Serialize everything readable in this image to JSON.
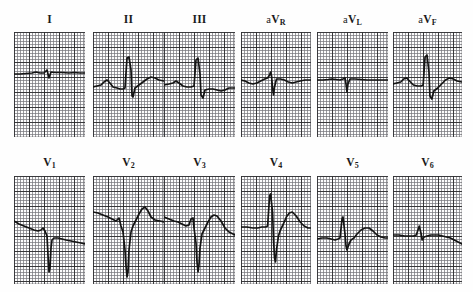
{
  "document": {
    "title": "12-Lead Electrocardiogram",
    "background_color": "#fefefe",
    "grid_fine_color": "#76767c",
    "grid_bold_color": "#28282a",
    "trace_color": "#141414"
  },
  "layout": {
    "rows": 2,
    "columns": 6,
    "panel_width": 71,
    "panel_height": 105,
    "panel_height_bottom": 108
  },
  "chart_data": {
    "type": "line",
    "xlabel": "Time",
    "ylabel": "Amplitude (mV)",
    "grid": "on",
    "legend": "none",
    "grid_small_mm": 1,
    "grid_large_mm": 5,
    "paper_speed": "25 mm/s",
    "calibration": "10 mm/mV",
    "series": [
      {
        "name": "I",
        "row": 0,
        "column": 0,
        "description": "low amplitude, nearly isoelectric with tiny QRS",
        "baseline_y": 73,
        "r_peak_y": 66,
        "s_nadir_y": 78,
        "points": "0,74 6,74 12,73.5 18,73 22,72 26,73 30,73 33,70 35,78 37,72 41,72.5 48,72.5 55,73 60,72.5 66,73 71,73"
      },
      {
        "name": "II",
        "row": 0,
        "column": 1,
        "description": "tall narrow R wave with deep S and upright T",
        "baseline_y": 88,
        "r_peak_y": 57,
        "s_nadir_y": 97,
        "points": "0,87 4,86 8,85 11,82 14,80 17,83 20,87 24,88 27,89 30,89 32,88 34,58 36,57 38,70 39,96 40,97 42,88 46,85 50,82 54,79 58,77 62,78 66,80 71,81"
      },
      {
        "name": "III",
        "row": 0,
        "column": 2,
        "description": "tall R wave with deep S wave and inverted/biphasic T",
        "baseline_y": 86,
        "r_peak_y": 58,
        "s_nadir_y": 98,
        "points": "0,85 5,84 9,83 12,81 15,83 19,86 23,87 27,87 30,86 32,60 34,58 36,74 37,95 39,98 41,90 45,89 49,89 53,90 57,91 61,90 65,88 71,88"
      },
      {
        "name": "aVR",
        "row": 0,
        "column": 3,
        "description": "small positive deflection with narrow downward spike",
        "baseline_y": 81,
        "r_peak_y": 72,
        "s_nadir_y": 95,
        "points": "0,80 4,81 8,83 12,84 16,83 20,81 24,79 27,78 29,75 30,72 31,76 32,88 33,95 34,87 36,79 40,79 44,80 48,82 52,83 56,82 60,81 65,80 71,80"
      },
      {
        "name": "aVL",
        "row": 0,
        "column": 4,
        "description": "almost flat isoelectric line with one small downward spike",
        "baseline_y": 80,
        "r_peak_y": 77,
        "s_nadir_y": 92,
        "points": "0,80 6,80 11,79.5 15,79 19,79.5 23,80 26,79 28,78 29,84 30,92 31,84 33,79 38,79 44,79.5 50,80 56,80 62,80 71,80"
      },
      {
        "name": "aVF",
        "row": 0,
        "column": 5,
        "description": "tall narrow R wave with deep S and upright T wave",
        "baseline_y": 85,
        "r_peak_y": 55,
        "s_nadir_y": 99,
        "points": "0,84 4,83 8,82 11,79 14,78 17,81 21,85 25,86 29,86 31,85 33,57 35,55 37,72 38,96 40,99 42,91 46,88 50,84 54,80 58,78 62,79 66,81 71,82"
      },
      {
        "name": "V1",
        "row": 1,
        "column": 0,
        "description": "rS pattern with deep narrow S wave, descending baseline",
        "baseline_y": 225,
        "r_peak_y": 222,
        "s_nadir_y": 272,
        "points": "0,221 5,224 10,226 15,228 20,230 24,231 27,230 29,228 31,231 33,236 34,255 35,272 36,268 37,248 38,240 40,238 44,238 48,239 52,240 57,241 62,242 67,243 71,244"
      },
      {
        "name": "V2",
        "row": 1,
        "column": 1,
        "description": "deep wide S wave with large upright T wave",
        "baseline_y": 232,
        "r_peak_y": 226,
        "s_nadir_y": 277,
        "points": "0,212 5,213 10,215 15,217 19,219 23,221 26,218 28,226 30,232 32,250 33,266 34,277 35,272 36,250 38,232 40,226 43,220 46,214 49,209 52,207 55,211 58,217 62,220 67,221 71,222"
      },
      {
        "name": "V3",
        "row": 1,
        "column": 2,
        "description": "rS complex with deep S wave and broad upright T",
        "baseline_y": 230,
        "r_peak_y": 218,
        "s_nadir_y": 272,
        "points": "0,217 5,219 10,221 14,222 18,224 22,226 25,225 27,219 29,218 30,228 32,243 33,262 34,272 35,265 36,248 38,234 41,228 44,222 47,217 50,215 53,216 57,221 61,228 65,232 71,235"
      },
      {
        "name": "V4",
        "row": 1,
        "column": 3,
        "description": "tall R wave with deep S wave and broad upright T",
        "baseline_y": 228,
        "r_peak_y": 194,
        "s_nadir_y": 262,
        "points": "0,227 6,227 12,228 17,228 21,227 25,227 27,226 29,196 30,194 32,212 33,240 34,258 35,262 36,250 38,236 40,230 43,224 46,217 49,213 52,212 56,216 60,222 64,226 68,228 71,228"
      },
      {
        "name": "V5",
        "row": 1,
        "column": 4,
        "description": "R wave of moderate amplitude with small T wave",
        "baseline_y": 238,
        "r_peak_y": 217,
        "s_nadir_y": 250,
        "points": "0,239 5,238 10,238 14,239 18,240 21,239 23,238 25,219 26,217 28,234 29,246 30,250 32,244 34,240 37,238 40,234 44,230 48,228 52,228 56,231 60,235 64,237 68,238 71,238"
      },
      {
        "name": "V6",
        "row": 1,
        "column": 5,
        "description": "small R wave, nearly flat baseline with slight downslope",
        "baseline_y": 236,
        "r_peak_y": 226,
        "s_nadir_y": 243,
        "points": "0,235 6,235 12,236 17,236 21,236 24,235 26,229 27,226 29,234 30,240 32,237 35,236 39,235 43,235 47,235 51,236 55,237 59,238 63,240 67,242 71,244"
      }
    ]
  },
  "leads": [
    {
      "id": "I",
      "prefix": "",
      "main": "I",
      "sub": "",
      "row": 0,
      "col": 0
    },
    {
      "id": "II",
      "prefix": "",
      "main": "II",
      "sub": "",
      "row": 0,
      "col": 1
    },
    {
      "id": "III",
      "prefix": "",
      "main": "III",
      "sub": "",
      "row": 0,
      "col": 2
    },
    {
      "id": "aVR",
      "prefix": "a",
      "main": "V",
      "sub": "R",
      "row": 0,
      "col": 3
    },
    {
      "id": "aVL",
      "prefix": "a",
      "main": "V",
      "sub": "L",
      "row": 0,
      "col": 4
    },
    {
      "id": "aVF",
      "prefix": "a",
      "main": "V",
      "sub": "F",
      "row": 0,
      "col": 5
    },
    {
      "id": "V1",
      "prefix": "",
      "main": "V",
      "sub": "1",
      "row": 1,
      "col": 0
    },
    {
      "id": "V2",
      "prefix": "",
      "main": "V",
      "sub": "2",
      "row": 1,
      "col": 1
    },
    {
      "id": "V3",
      "prefix": "",
      "main": "V",
      "sub": "3",
      "row": 1,
      "col": 2
    },
    {
      "id": "V4",
      "prefix": "",
      "main": "V",
      "sub": "4",
      "row": 1,
      "col": 3
    },
    {
      "id": "V5",
      "prefix": "",
      "main": "V",
      "sub": "5",
      "row": 1,
      "col": 4
    },
    {
      "id": "V6",
      "prefix": "",
      "main": "V",
      "sub": "6",
      "row": 1,
      "col": 5
    }
  ]
}
